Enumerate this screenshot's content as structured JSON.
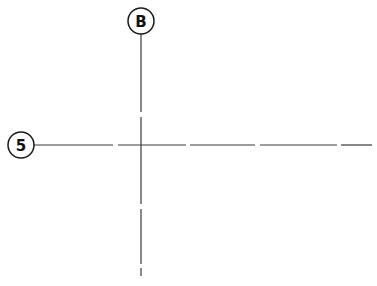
{
  "diagram": {
    "type": "architectural-grid",
    "colors": {
      "line": "#3a3a3a",
      "bubble_stroke": "#1a1a1a",
      "background": "#ffffff"
    },
    "grid_lines": [
      {
        "id": "B",
        "label": "B",
        "orientation": "vertical",
        "bubble": {
          "cx": 141,
          "cy": 21,
          "r": 13
        },
        "line": {
          "x": 141,
          "y1": 34,
          "y2": 276
        },
        "gaps": [
          [
            112,
            117
          ],
          [
            204,
            209
          ],
          [
            264,
            268
          ]
        ]
      },
      {
        "id": "5",
        "label": "5",
        "orientation": "horizontal",
        "bubble": {
          "cx": 21,
          "cy": 145,
          "r": 13
        },
        "line": {
          "y": 145,
          "x1": 34,
          "x2": 372
        },
        "gaps": [
          [
            113,
            118
          ],
          [
            186,
            190
          ],
          [
            255,
            260
          ],
          [
            337,
            341
          ]
        ]
      }
    ]
  }
}
